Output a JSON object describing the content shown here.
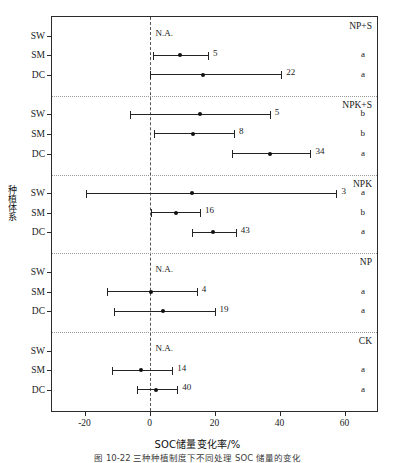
{
  "chart_data": {
    "type": "scatter",
    "title": "",
    "xlabel": "SOC储量变化率/%",
    "ylabel": "种植体系",
    "xlim": [
      -30,
      70
    ],
    "xticks": [
      -20,
      0,
      20,
      40,
      60
    ],
    "xticklabels": [
      "-20",
      "0",
      "20",
      "40",
      "60"
    ],
    "grid": false,
    "zero_reference_line": 0,
    "legend": "none",
    "categories": [
      "SW",
      "SM",
      "DC"
    ],
    "groups": [
      {
        "name": "NP+S",
        "rows": [
          {
            "system": "SW",
            "mean": null,
            "low": null,
            "high": null,
            "value_label": "N.A.",
            "letter": "",
            "na": true
          },
          {
            "system": "SM",
            "mean": 9.5,
            "low": 1.0,
            "high": 18.0,
            "value_label": "5",
            "letter": "a",
            "na": false
          },
          {
            "system": "DC",
            "mean": 16.5,
            "low": 0.0,
            "high": 40.5,
            "value_label": "22",
            "letter": "a",
            "na": false
          }
        ]
      },
      {
        "name": "NPK+S",
        "rows": [
          {
            "system": "SW",
            "mean": 15.5,
            "low": -6.0,
            "high": 37.0,
            "value_label": "5",
            "letter": "b",
            "na": false
          },
          {
            "system": "SM",
            "mean": 13.5,
            "low": 1.5,
            "high": 26.0,
            "value_label": "8",
            "letter": "b",
            "na": false
          },
          {
            "system": "DC",
            "mean": 37.0,
            "low": 25.5,
            "high": 49.5,
            "value_label": "34",
            "letter": "a",
            "na": false
          }
        ]
      },
      {
        "name": "NPK",
        "rows": [
          {
            "system": "SW",
            "mean": 13.0,
            "low": -19.5,
            "high": 57.5,
            "value_label": "3",
            "letter": "a",
            "na": false
          },
          {
            "system": "SM",
            "mean": 8.0,
            "low": 0.5,
            "high": 15.5,
            "value_label": "16",
            "letter": "b",
            "na": false
          },
          {
            "system": "DC",
            "mean": 19.5,
            "low": 13.0,
            "high": 26.5,
            "value_label": "43",
            "letter": "a",
            "na": false
          }
        ]
      },
      {
        "name": "NP",
        "rows": [
          {
            "system": "SW",
            "mean": null,
            "low": null,
            "high": null,
            "value_label": "N.A.",
            "letter": "",
            "na": true
          },
          {
            "system": "SM",
            "mean": 0.5,
            "low": -13.0,
            "high": 14.5,
            "value_label": "4",
            "letter": "a",
            "na": false
          },
          {
            "system": "DC",
            "mean": 4.0,
            "low": -11.0,
            "high": 20.0,
            "value_label": "19",
            "letter": "a",
            "na": false
          }
        ]
      },
      {
        "name": "CK",
        "rows": [
          {
            "system": "SW",
            "mean": null,
            "low": null,
            "high": null,
            "value_label": "N.A.",
            "letter": "",
            "na": true
          },
          {
            "system": "SM",
            "mean": -2.5,
            "low": -11.5,
            "high": 7.0,
            "value_label": "14",
            "letter": "a",
            "na": false
          },
          {
            "system": "DC",
            "mean": 2.0,
            "low": -4.0,
            "high": 8.5,
            "value_label": "40",
            "letter": "a",
            "na": false
          }
        ]
      }
    ]
  },
  "figure": {
    "caption": "图 10-22   三种种植制度下不同处理 SOC 储量的变化"
  },
  "colors": {
    "axis": "#2b2b2b",
    "marker": "#111111",
    "zero_line": "#555555",
    "separator": "#9a9a9a"
  }
}
